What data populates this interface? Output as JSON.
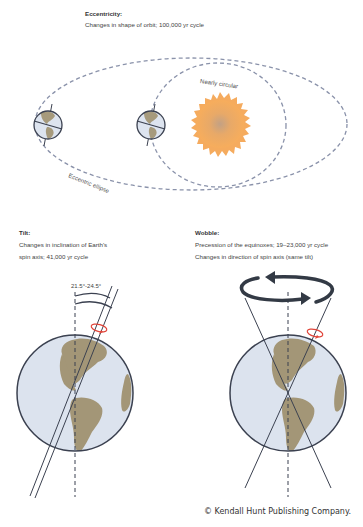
{
  "eccentricity": {
    "title": "Eccentricity:",
    "description": "Changes in shape of orbit; 100,000 yr cycle",
    "labels": {
      "inner_orbit": "Nearly circular",
      "outer_orbit": "Eccentric ellipse"
    }
  },
  "tilt": {
    "title": "Tilt:",
    "description_lines": [
      "Changes in inclination of Earth's",
      "spin axis; 41,000 yr cycle"
    ],
    "angle_label": "21.5°-24.5°"
  },
  "wobble": {
    "title": "Wobble:",
    "description_lines": [
      "Precession of the equinoxes; 19–23,000 yr cycle",
      "Changes in direction of spin axis (same tilt)"
    ]
  },
  "credit": "© Kendall Hunt Publishing Company.",
  "colors": {
    "orbit": "#7d86a0",
    "earth_ocean": "#dce3ee",
    "earth_land": "#a39677",
    "earth_outline": "#3b4150",
    "sun_outer": "#f5a95a",
    "sun_inner": "#c9a07a",
    "spin_arrow": "#e0453a",
    "axis": "#3b4150"
  }
}
